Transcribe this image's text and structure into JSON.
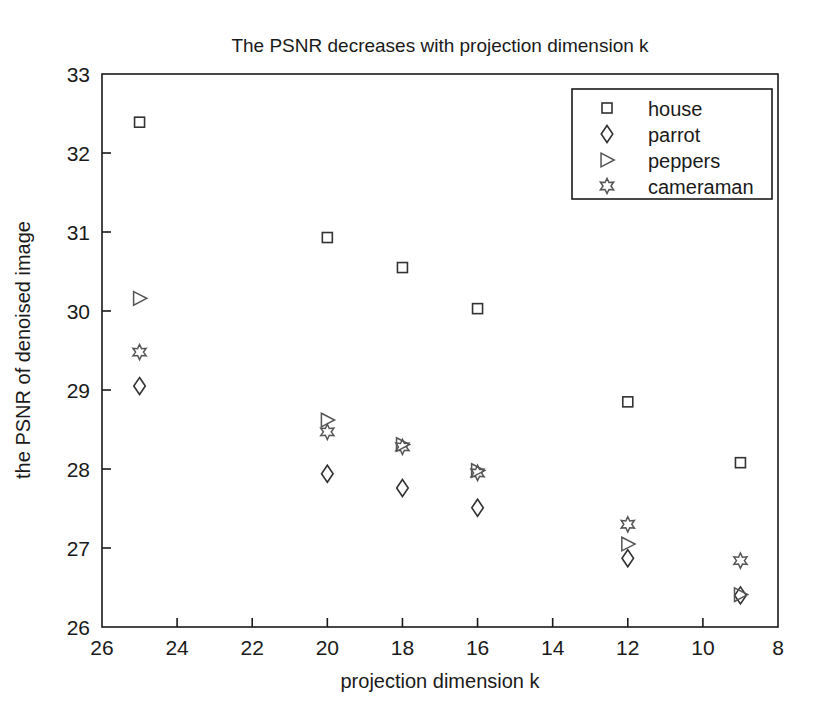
{
  "chart_data": {
    "type": "scatter",
    "title": "The PSNR decreases with projection dimension k",
    "xlabel": "projection dimension k",
    "ylabel": "the PSNR of denoised image",
    "xlim": [
      26,
      8
    ],
    "ylim": [
      26,
      33
    ],
    "x_reversed": true,
    "grid": false,
    "legend_position": "top-right",
    "xticks": [
      26,
      24,
      22,
      20,
      18,
      16,
      14,
      12,
      10,
      8
    ],
    "yticks": [
      26,
      27,
      28,
      29,
      30,
      31,
      32,
      33
    ],
    "x": [
      25,
      20,
      18,
      16,
      12,
      9
    ],
    "series": [
      {
        "name": "house",
        "marker": "square",
        "values": [
          32.39,
          30.93,
          30.55,
          30.03,
          28.85,
          28.08
        ]
      },
      {
        "name": "parrot",
        "marker": "diamond",
        "values": [
          29.05,
          27.94,
          27.76,
          27.51,
          26.87,
          26.4
        ]
      },
      {
        "name": "peppers",
        "marker": "right-triangle",
        "values": [
          30.16,
          28.62,
          28.31,
          27.98,
          27.05,
          26.41
        ]
      },
      {
        "name": "cameraman",
        "marker": "hexagram",
        "values": [
          29.48,
          28.47,
          28.28,
          27.95,
          27.3,
          26.84
        ]
      }
    ]
  },
  "legend": {
    "entries": [
      {
        "label": "house",
        "marker": "square"
      },
      {
        "label": "parrot",
        "marker": "diamond"
      },
      {
        "label": "peppers",
        "marker": "right-triangle"
      },
      {
        "label": "cameraman",
        "marker": "hexagram"
      }
    ]
  },
  "axes": {
    "x_tick_labels": [
      "26",
      "24",
      "22",
      "20",
      "18",
      "16",
      "14",
      "12",
      "10",
      "8"
    ],
    "y_tick_labels": [
      "26",
      "27",
      "28",
      "29",
      "30",
      "31",
      "32",
      "33"
    ]
  }
}
